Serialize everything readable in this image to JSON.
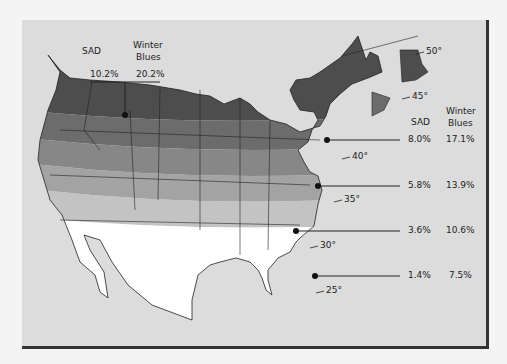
{
  "map": {
    "title": "",
    "colors": {
      "background": "#f4f4f4",
      "panel": "#dcdcdc",
      "band_1": "#4d4d4d",
      "band_2": "#6c6c6c",
      "band_3": "#878787",
      "band_4": "#a3a3a3",
      "band_5": "#c3c3c3",
      "band_6": "#ffffff",
      "frame": "#333333"
    },
    "top_legend": {
      "sad_header": "SAD",
      "winter_header_1": "Winter",
      "winter_header_2": "Blues",
      "sad_value": "10.2%",
      "winter_value": "20.2%"
    },
    "right_legend": {
      "sad_header": "SAD",
      "winter_header_1": "Winter",
      "winter_header_2": "Blues",
      "rows": [
        {
          "sad": "8.0%",
          "winter": "17.1%"
        },
        {
          "sad": "5.8%",
          "winter": "13.9%"
        },
        {
          "sad": "3.6%",
          "winter": "10.6%"
        },
        {
          "sad": "1.4%",
          "winter": "7.5%"
        }
      ]
    },
    "latitudes": [
      "50°",
      "45°",
      "40°",
      "35°",
      "30°",
      "25°"
    ]
  }
}
